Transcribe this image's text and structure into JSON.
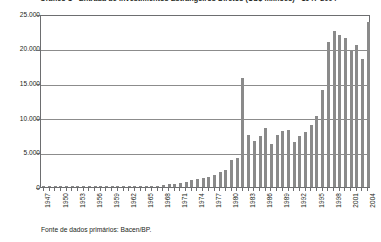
{
  "chart_data": {
    "type": "bar",
    "title": "Gráfico 1 - Entrada de Investimentos Estrangeiros Diretos (US$ milhões) - 1947-2004",
    "subtitle": "",
    "xlabel": "",
    "ylabel": "",
    "ylim": [
      0,
      25000
    ],
    "yticks": [
      0,
      5000,
      10000,
      15000,
      20000,
      25000
    ],
    "ytick_labels": [
      "0",
      "5.000",
      "10.000",
      "15.000",
      "20.000",
      "25.000"
    ],
    "grid": true,
    "legend": null,
    "source_note": "Fonte de dados primários: Bacen/BP.",
    "xtick_labels": [
      "1947",
      "1950",
      "1953",
      "1956",
      "1959",
      "1962",
      "1965",
      "1968",
      "1971",
      "1974",
      "1977",
      "1980",
      "1983",
      "1986",
      "1989",
      "1992",
      "1995",
      "1998",
      "2001",
      "2004"
    ],
    "categories": [
      "1947",
      "1948",
      "1949",
      "1950",
      "1951",
      "1952",
      "1953",
      "1954",
      "1955",
      "1956",
      "1957",
      "1958",
      "1959",
      "1960",
      "1961",
      "1962",
      "1963",
      "1964",
      "1965",
      "1966",
      "1967",
      "1968",
      "1969",
      "1970",
      "1971",
      "1972",
      "1973",
      "1974",
      "1975",
      "1976",
      "1977",
      "1978",
      "1979",
      "1980",
      "1981",
      "1982",
      "1983",
      "1984",
      "1985",
      "1986",
      "1987",
      "1988",
      "1989",
      "1990",
      "1991",
      "1992",
      "1993",
      "1994",
      "1995",
      "1996",
      "1997",
      "1998",
      "1999",
      "2000",
      "2001",
      "2002",
      "2003",
      "2004"
    ],
    "values": [
      80,
      90,
      85,
      100,
      120,
      130,
      110,
      140,
      150,
      160,
      170,
      160,
      180,
      170,
      190,
      180,
      160,
      150,
      170,
      190,
      210,
      300,
      380,
      420,
      520,
      700,
      950,
      1100,
      1300,
      1450,
      1800,
      2100,
      2400,
      3900,
      4150,
      15700,
      7500,
      6600,
      7400,
      8500,
      6200,
      7500,
      8100,
      8300,
      6500,
      7300,
      7900,
      9000,
      10200,
      14000,
      21000,
      22500,
      22000,
      21500,
      19800,
      20500,
      18500,
      23800
    ],
    "bar_color": "#8a8a8a",
    "grid_color": "#8c8c8c",
    "axis_color": "#6d6e70",
    "background": "#ffffff"
  }
}
